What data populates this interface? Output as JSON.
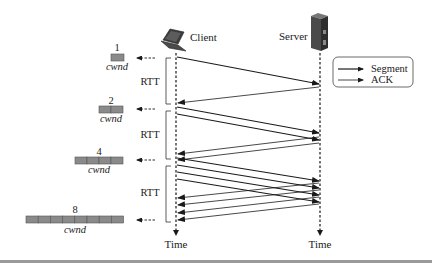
{
  "hosts": {
    "client": {
      "label": "Client",
      "icon": "laptop-icon"
    },
    "server": {
      "label": "Server",
      "icon": "server-icon"
    }
  },
  "timeline": {
    "client_time_label": "Time",
    "server_time_label": "Time"
  },
  "legend": {
    "segment_label": "Segment",
    "ack_label": "ACK"
  },
  "rtt_labels": [
    "RTT",
    "RTT",
    "RTT"
  ],
  "cwnd": [
    {
      "count": "1",
      "label": "cwnd",
      "segments": 1
    },
    {
      "count": "2",
      "label": "cwnd",
      "segments": 2
    },
    {
      "count": "4",
      "label": "cwnd",
      "segments": 4
    },
    {
      "count": "8",
      "label": "cwnd",
      "segments": 8
    }
  ],
  "colors": {
    "line": "#1a1a1a",
    "cwnd_fill": "#8a8a8a",
    "cwnd_stroke": "#555555",
    "rule": "#9a9a9a"
  }
}
